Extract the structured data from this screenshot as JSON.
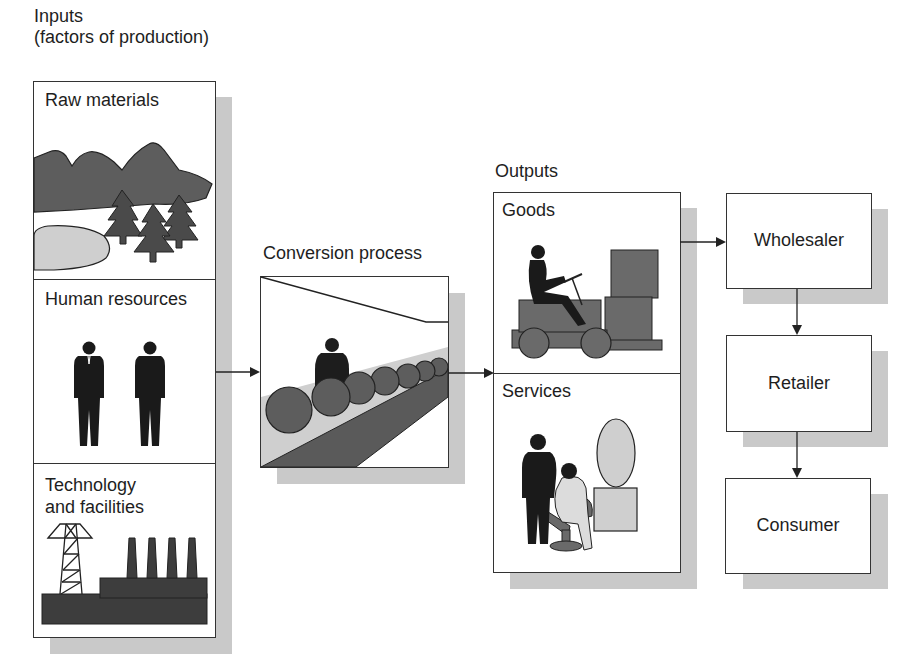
{
  "inputs": {
    "title_line1": "Inputs",
    "title_line2": "(factors of production)",
    "sections": [
      {
        "label": "Raw materials",
        "icon": "landscape-mountains-trees-icon"
      },
      {
        "label": "Human resources",
        "icon": "workers-icon"
      },
      {
        "label_line1": "Technology",
        "label_line2": "and facilities",
        "icon": "factory-power-tower-icon"
      }
    ]
  },
  "conversion": {
    "title": "Conversion process",
    "icon": "assembly-line-icon"
  },
  "outputs": {
    "title": "Outputs",
    "sections": [
      {
        "label": "Goods",
        "icon": "forklift-icon"
      },
      {
        "label": "Services",
        "icon": "hairdresser-icon"
      }
    ]
  },
  "distribution": {
    "boxes": [
      {
        "label": "Wholesaler"
      },
      {
        "label": "Retailer"
      },
      {
        "label": "Consumer"
      }
    ]
  },
  "colors": {
    "dark_fill": "#444444",
    "mid_fill": "#6a6a6a",
    "light_fill": "#cfcfcf",
    "shadow": "#c9c9c9",
    "stroke": "#333333"
  }
}
